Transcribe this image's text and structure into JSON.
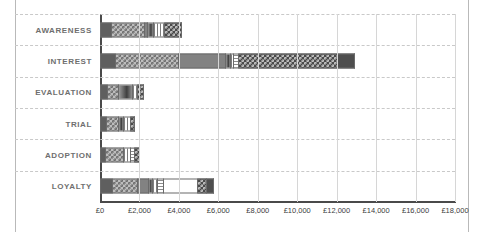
{
  "chart_data": {
    "type": "bar",
    "orientation": "horizontal",
    "stacked": true,
    "title": "",
    "xlabel": "",
    "ylabel": "",
    "xlim": [
      0,
      18000
    ],
    "xtick_step": 2000,
    "grid": true,
    "legend": "none",
    "currency_symbol": "£",
    "categories": [
      "AWARENESS",
      "INTEREST",
      "EVALUATION",
      "TRIAL",
      "ADOPTION",
      "LOYALTY"
    ],
    "xticks": [
      "£0",
      "£2,000",
      "£4,000",
      "£6,000",
      "£8,000",
      "£10,000",
      "£12,000",
      "£14,000",
      "£16,000",
      "£18,000"
    ],
    "xtick_values": [
      0,
      2000,
      4000,
      6000,
      8000,
      10000,
      12000,
      14000,
      16000,
      18000
    ],
    "series": [
      {
        "name": "Segment 1",
        "pattern": "solid-dark",
        "values": [
          600,
          800,
          400,
          350,
          300,
          650
        ]
      },
      {
        "name": "Segment 2",
        "pattern": "checker-lg",
        "values": [
          1700,
          3200,
          550,
          600,
          900,
          1300
        ]
      },
      {
        "name": "Segment 3",
        "pattern": "solid-mid",
        "values": [
          150,
          2400,
          0,
          0,
          0,
          550
        ]
      },
      {
        "name": "Segment 4",
        "pattern": "gradient",
        "values": [
          300,
          250,
          700,
          250,
          0,
          200
        ]
      },
      {
        "name": "Segment 5",
        "pattern": "vstripe",
        "values": [
          550,
          150,
          300,
          350,
          350,
          250
        ]
      },
      {
        "name": "Segment 6",
        "pattern": "hstripe",
        "values": [
          0,
          250,
          0,
          0,
          250,
          300
        ]
      },
      {
        "name": "Segment 7",
        "pattern": "solid-light",
        "values": [
          0,
          0,
          0,
          0,
          0,
          1700
        ]
      },
      {
        "name": "Segment 8",
        "pattern": "checker-dark",
        "values": [
          850,
          5000,
          300,
          250,
          250,
          500
        ]
      },
      {
        "name": "Segment 9",
        "pattern": "solid-darker",
        "values": [
          0,
          900,
          0,
          0,
          0,
          350
        ]
      }
    ],
    "totals": [
      4150,
      12950,
      2250,
      1800,
      2050,
      5800
    ],
    "total_labels": [
      "£4,150",
      "£12,950",
      "£2,250",
      "£1,800",
      "£2,050",
      "£5,800"
    ]
  }
}
